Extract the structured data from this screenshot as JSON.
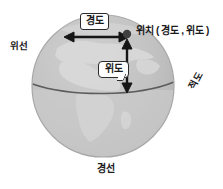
{
  "diagram": {
    "labels": {
      "longitude": "경도",
      "latitude": "위도",
      "position": "위치 ( 경도 , 위도 )",
      "parallel": "위선",
      "equator": "적도",
      "meridian": "경선"
    },
    "globe": {
      "center_x": 103,
      "center_y": 86,
      "radius": 71,
      "ocean_color": "#bdbdbd",
      "land_color": "#d2d2d2",
      "lower_hemisphere_color": "#c6c6c6",
      "rim_color": "#ababab",
      "equator_line_color": "#5f5f5f",
      "equator_line_y": 90
    },
    "markers": {
      "point_label": "위치 지점",
      "point_x": 127,
      "point_y": 33,
      "point_color": "#3d3d3d"
    },
    "arrows": {
      "color": "#151515",
      "horizontal": {
        "name": "경도 화살표",
        "x1": 66,
        "x2": 127,
        "y": 37
      },
      "vertical": {
        "name": "위도 화살표",
        "x": 127,
        "y1": 41,
        "y2": 92
      }
    },
    "background_color": "#ffffff"
  }
}
